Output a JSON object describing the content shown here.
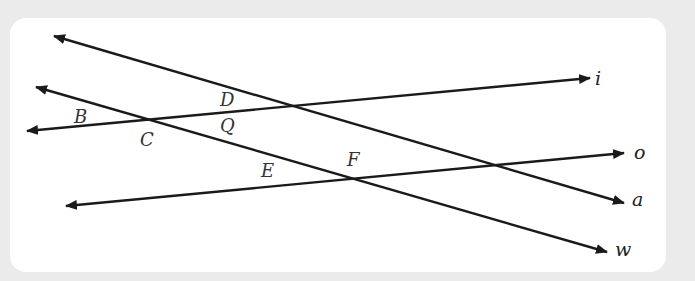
{
  "diagram": {
    "type": "lines and intersection points",
    "lines": [
      {
        "name": "a",
        "label": "a",
        "from": [
          54,
          36
        ],
        "to": [
          624,
          203
        ],
        "arrows": "both"
      },
      {
        "name": "w",
        "label": "w",
        "from": [
          36,
          87
        ],
        "to": [
          607,
          252
        ],
        "arrows": "both"
      },
      {
        "name": "i",
        "label": "i",
        "from": [
          27,
          131
        ],
        "to": [
          590,
          78
        ],
        "arrows": "both"
      },
      {
        "name": "o",
        "label": "o",
        "from": [
          66,
          206
        ],
        "to": [
          624,
          153
        ],
        "arrows": "both"
      }
    ],
    "points": [
      {
        "label": "B"
      },
      {
        "label": "C"
      },
      {
        "label": "D"
      },
      {
        "label": "Q"
      },
      {
        "label": "E"
      },
      {
        "label": "F"
      }
    ],
    "line_labels": {
      "i": "i",
      "o": "o",
      "a": "a",
      "w": "w"
    },
    "point_labels": {
      "B": "B",
      "C": "C",
      "D": "D",
      "Q": "Q",
      "E": "E",
      "F": "F"
    },
    "colors": {
      "line": "#1a1a1a",
      "background": "#ebebeb",
      "card": "#ffffff"
    }
  }
}
